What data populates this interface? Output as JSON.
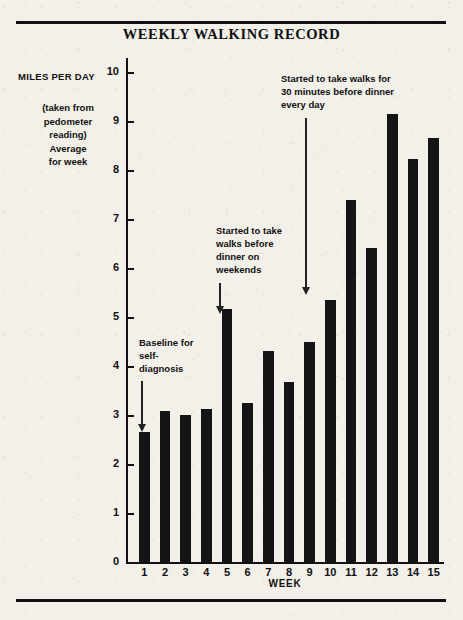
{
  "title": "WEEKLY WALKING RECORD",
  "axes": {
    "y_label_main": "MILES PER DAY",
    "y_label_sub": "(taken from pedometer reading) Average for week",
    "x_label": "WEEK"
  },
  "annotations": [
    {
      "text": "Baseline for self-diagnosis",
      "target_week": 1
    },
    {
      "text": "Started to take walks before dinner on weekends",
      "target_week": 5
    },
    {
      "text": "Started to take walks for 30 minutes before dinner every day",
      "target_week": 10
    }
  ],
  "colors": {
    "bar": "#141414",
    "paper": "#f2f0e9",
    "ink": "#111111"
  },
  "chart_data": {
    "type": "bar",
    "title": "WEEKLY WALKING RECORD",
    "xlabel": "WEEK",
    "ylabel": "MILES PER DAY",
    "ylabel_note": "(taken from pedometer reading) Average for week",
    "categories": [
      "1",
      "2",
      "3",
      "4",
      "5",
      "6",
      "7",
      "8",
      "9",
      "10",
      "11",
      "12",
      "13",
      "14",
      "15"
    ],
    "values": [
      2.65,
      3.08,
      3.0,
      3.13,
      5.17,
      3.25,
      4.3,
      3.68,
      4.5,
      5.35,
      7.38,
      6.4,
      9.15,
      8.22,
      8.65
    ],
    "ylim": [
      0,
      10
    ],
    "yticks": [
      0,
      1,
      2,
      3,
      4,
      5,
      6,
      7,
      8,
      9,
      10
    ],
    "grid": false,
    "legend": false,
    "annotations": [
      {
        "text": "Baseline for self-diagnosis",
        "points_to_category": "1"
      },
      {
        "text": "Started to take walks before dinner on weekends",
        "points_to_category": "5"
      },
      {
        "text": "Started to take walks for 30 minutes before dinner every day",
        "points_to_category": "10"
      }
    ]
  },
  "annotation_lines": {
    "a1": [
      "Baseline for",
      "self-",
      "diagnosis"
    ],
    "a2": [
      "Started to take",
      "walks before",
      "dinner on",
      "weekends"
    ],
    "a3": [
      "Started to take walks for",
      "30 minutes before dinner",
      "every day"
    ]
  }
}
